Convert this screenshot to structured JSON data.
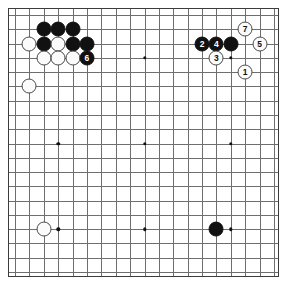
{
  "board": {
    "kind": "go-board",
    "size": 19,
    "background_color": "#ffffff",
    "line_color": "#6e6e6e",
    "border_color": "#3c3c3c",
    "black_color": "#111111",
    "white_color": "#fbfbfb",
    "star_points": [
      {
        "col": 3,
        "row": 3
      },
      {
        "col": 9,
        "row": 3
      },
      {
        "col": 15,
        "row": 3
      },
      {
        "col": 3,
        "row": 9
      },
      {
        "col": 9,
        "row": 9
      },
      {
        "col": 15,
        "row": 9
      },
      {
        "col": 3,
        "row": 15
      },
      {
        "col": 9,
        "row": 15
      },
      {
        "col": 15,
        "row": 15
      }
    ]
  },
  "stones": [
    {
      "color": "black",
      "col": 2,
      "row": 1,
      "label": ""
    },
    {
      "color": "black",
      "col": 3,
      "row": 1,
      "label": ""
    },
    {
      "color": "black",
      "col": 4,
      "row": 1,
      "label": ""
    },
    {
      "color": "white",
      "col": 1,
      "row": 2,
      "label": ""
    },
    {
      "color": "black",
      "col": 2,
      "row": 2,
      "label": ""
    },
    {
      "color": "white",
      "col": 3,
      "row": 2,
      "label": ""
    },
    {
      "color": "black",
      "col": 4,
      "row": 2,
      "label": ""
    },
    {
      "color": "black",
      "col": 5,
      "row": 2,
      "label": ""
    },
    {
      "color": "white",
      "col": 2,
      "row": 3,
      "label": ""
    },
    {
      "color": "white",
      "col": 3,
      "row": 3,
      "label": ""
    },
    {
      "color": "white",
      "col": 4,
      "row": 3,
      "label": ""
    },
    {
      "color": "black",
      "col": 5,
      "row": 3,
      "label": "6"
    },
    {
      "color": "white",
      "col": 1,
      "row": 5,
      "label": ""
    },
    {
      "color": "black",
      "col": 13,
      "row": 2,
      "label": "2"
    },
    {
      "color": "black",
      "col": 14,
      "row": 2,
      "label": "4"
    },
    {
      "color": "black",
      "col": 15,
      "row": 2,
      "label": ""
    },
    {
      "color": "white",
      "col": 16,
      "row": 1,
      "label": "7"
    },
    {
      "color": "white",
      "col": 17,
      "row": 2,
      "label": "5"
    },
    {
      "color": "white",
      "col": 14,
      "row": 3,
      "label": "3"
    },
    {
      "color": "white",
      "col": 16,
      "row": 4,
      "label": "1"
    },
    {
      "color": "white",
      "col": 2,
      "row": 15,
      "label": ""
    },
    {
      "color": "black",
      "col": 14,
      "row": 15,
      "label": ""
    }
  ],
  "move_sequence": [
    {
      "number": "1",
      "color": "white"
    },
    {
      "number": "2",
      "color": "black"
    },
    {
      "number": "3",
      "color": "white"
    },
    {
      "number": "4",
      "color": "black"
    },
    {
      "number": "5",
      "color": "white"
    },
    {
      "number": "6",
      "color": "black"
    },
    {
      "number": "7",
      "color": "white"
    }
  ]
}
